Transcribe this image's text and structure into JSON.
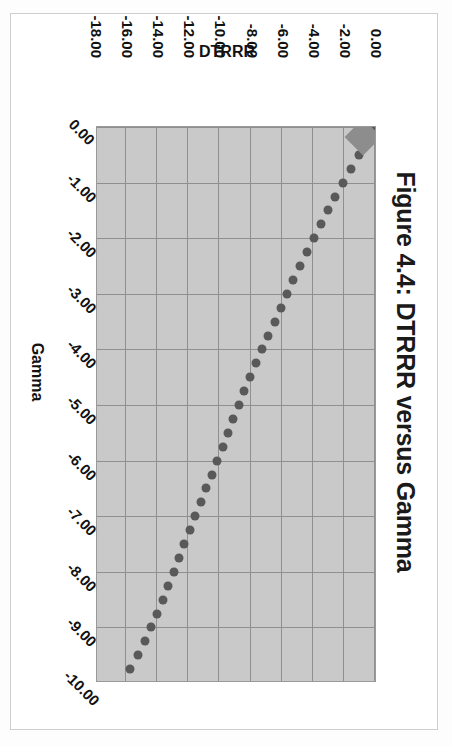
{
  "figure": {
    "title": "Figure 4.4: DTRRR versus Gamma",
    "border_color": "#cfcfcf",
    "plot_bg": "#c9c9c9",
    "gridline_color": "#8f8f8f",
    "point_color": "#595959",
    "marker_color": "#8d8d8d"
  },
  "chart_data": {
    "type": "scatter",
    "title": "Figure 4.4: DTRRR versus Gamma",
    "xlabel": "Gamma",
    "ylabel": "DTRRR",
    "xlim": [
      -10.0,
      0.0
    ],
    "ylim": [
      -18.0,
      0.0
    ],
    "xticks": [
      "0.00",
      "-1.00",
      "-2.00",
      "-3.00",
      "-4.00",
      "-5.00",
      "-6.00",
      "-7.00",
      "-8.00",
      "-9.00",
      "-10.00"
    ],
    "xtick_values": [
      0.0,
      -1.0,
      -2.0,
      -3.0,
      -4.0,
      -5.0,
      -6.0,
      -7.0,
      -8.0,
      -9.0,
      -10.0
    ],
    "yticks": [
      "0.00",
      "-2.00",
      "-4.00",
      "-6.00",
      "-8.00",
      "-10.00",
      "-12.00",
      "-14.00",
      "-16.00",
      "-18.00"
    ],
    "ytick_values": [
      0.0,
      -2.0,
      -4.0,
      -6.0,
      -8.0,
      -10.0,
      -12.0,
      -14.0,
      -16.0,
      -18.0
    ],
    "grid": true,
    "legend": false,
    "series": [
      {
        "name": "DTRRR",
        "marker": "circle",
        "x": [
          0.0,
          -0.25,
          -0.5,
          -0.75,
          -1.0,
          -1.25,
          -1.5,
          -1.75,
          -2.0,
          -2.25,
          -2.5,
          -2.75,
          -3.0,
          -3.25,
          -3.5,
          -3.75,
          -4.0,
          -4.25,
          -4.5,
          -4.75,
          -5.0,
          -5.25,
          -5.5,
          -5.75,
          -6.0,
          -6.25,
          -6.5,
          -6.75,
          -7.0,
          -7.25,
          -7.5,
          -7.75,
          -8.0,
          -8.25,
          -8.5,
          -8.75,
          -9.0,
          -9.25,
          -9.5,
          -9.75
        ],
        "y": [
          -0.05,
          -0.55,
          -1.05,
          -1.55,
          -2.05,
          -2.55,
          -3.0,
          -3.45,
          -3.9,
          -4.35,
          -4.8,
          -5.25,
          -5.65,
          -6.05,
          -6.45,
          -6.85,
          -7.25,
          -7.65,
          -8.05,
          -8.4,
          -8.75,
          -9.1,
          -9.45,
          -9.8,
          -10.15,
          -10.5,
          -10.85,
          -11.2,
          -11.55,
          -11.9,
          -12.25,
          -12.6,
          -12.95,
          -13.3,
          -13.65,
          -14.0,
          -14.4,
          -14.8,
          -15.25,
          -15.75
        ]
      }
    ],
    "highlight_marker": {
      "shape": "diamond",
      "x": -0.18,
      "y": -0.75,
      "color": "#8d8d8d"
    }
  }
}
